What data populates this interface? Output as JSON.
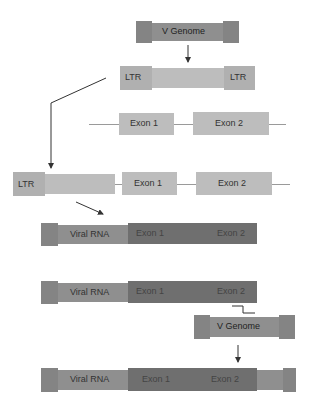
{
  "diagram": {
    "top_genome": {
      "label": "V Genome"
    },
    "provirus": {
      "ltr_left": "LTR",
      "ltr_right": "LTR"
    },
    "host_gene": {
      "exon1": "Exon 1",
      "exon2": "Exon 2"
    },
    "integrated": {
      "ltr": "LTR",
      "exon1": "Exon 1",
      "exon2": "Exon 2"
    },
    "transcript1": {
      "viral": "Viral RNA",
      "exon1": "Exon 1",
      "exon2": "Exon 2"
    },
    "transcript2": {
      "viral": "Viral RNA",
      "exon1": "Exon 1",
      "exon2": "Exon 2"
    },
    "second_genome": {
      "label": "V Genome"
    },
    "final": {
      "viral": "Viral RNA",
      "exon1": "Exon 1",
      "exon2": "Exon 2"
    }
  }
}
